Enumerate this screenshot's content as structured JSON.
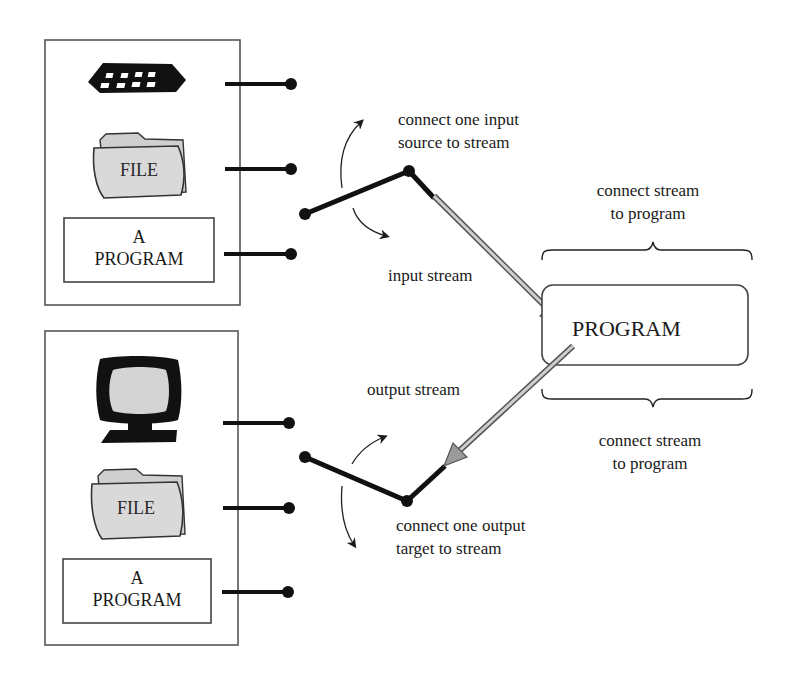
{
  "diagram": {
    "input_group": {
      "devices": [
        {
          "name": "keyboard",
          "icon": "keyboard-icon"
        },
        {
          "name": "file",
          "label": "FILE",
          "icon": "folder-icon"
        },
        {
          "name": "program",
          "label_line1": "A",
          "label_line2": "PROGRAM"
        }
      ],
      "switch_label_line1": "connect one input",
      "switch_label_line2": "source to stream",
      "stream_label": "input stream"
    },
    "output_group": {
      "devices": [
        {
          "name": "monitor",
          "icon": "monitor-icon"
        },
        {
          "name": "file",
          "label": "FILE",
          "icon": "folder-icon"
        },
        {
          "name": "program",
          "label_line1": "A",
          "label_line2": "PROGRAM"
        }
      ],
      "switch_label_line1": "connect one output",
      "switch_label_line2": "target to stream",
      "stream_label": "output stream"
    },
    "program": {
      "label": "PROGRAM",
      "top_brace_label_line1": "connect stream",
      "top_brace_label_line2": "to program",
      "bottom_brace_label_line1": "connect stream",
      "bottom_brace_label_line2": "to program"
    },
    "colors": {
      "ink": "#1a1a1a",
      "box_border": "#555555",
      "folder_fill": "#d9d9d9",
      "screen_fill": "#d4d4d4",
      "stream_fill": "#c8c8c8"
    }
  }
}
